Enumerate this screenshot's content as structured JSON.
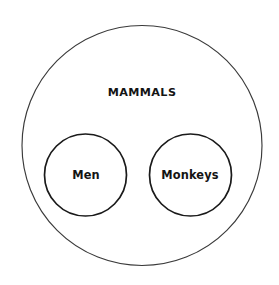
{
  "diagram": {
    "type": "euler-diagram",
    "title_label": "MAMMALS",
    "background_color": "#ffffff",
    "outer_stroke_color": "#3a3a3a",
    "inner_stroke_color": "#1a1a1a",
    "label_color": "#141414",
    "sets": [
      {
        "id": "mammals",
        "label": "MAMMALS",
        "role": "universe",
        "shape": "circle",
        "cx": 142,
        "cy": 145.5,
        "r": 120,
        "label_x": 142,
        "label_y": 93,
        "contains": [
          "men",
          "monkeys"
        ]
      },
      {
        "id": "men",
        "label": "Men",
        "role": "subset",
        "shape": "circle",
        "cx": 85.5,
        "cy": 175,
        "r": 41,
        "label_x": 86,
        "label_y": 175,
        "parent": "mammals",
        "overlaps": []
      },
      {
        "id": "monkeys",
        "label": "Monkeys",
        "role": "subset",
        "shape": "circle",
        "cx": 190.5,
        "cy": 175,
        "r": 41,
        "label_x": 190,
        "label_y": 175,
        "parent": "mammals",
        "overlaps": []
      }
    ]
  }
}
